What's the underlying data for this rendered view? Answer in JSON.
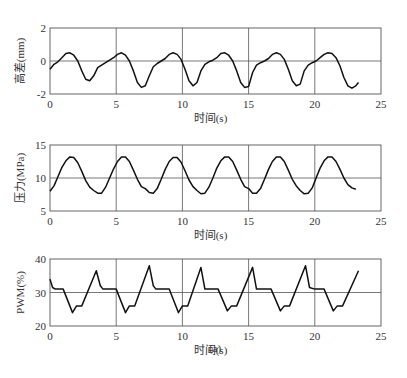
{
  "caption": "(a)",
  "chart_data": [
    {
      "type": "line",
      "title": "",
      "xlabel": "时间(s)",
      "ylabel": "高差(mm)",
      "xlim": [
        0,
        25
      ],
      "ylim": [
        -2,
        2
      ],
      "xticks": [
        0,
        5,
        10,
        15,
        20,
        25
      ],
      "yticks": [
        -2,
        0,
        2
      ],
      "grid": true,
      "frame": {
        "x0": 50,
        "x1": 381,
        "y0": 28,
        "y1": 94
      },
      "series": [
        {
          "name": "高差",
          "x": [
            0,
            0.3,
            0.6,
            0.9,
            1.2,
            1.5,
            1.8,
            2.1,
            2.4,
            2.7,
            3.0,
            3.3,
            3.6,
            3.9,
            4.2,
            4.5,
            4.8,
            5.1,
            5.4,
            5.7,
            6.0,
            6.3,
            6.6,
            6.9,
            7.2,
            7.5,
            7.8,
            8.1,
            8.4,
            8.7,
            9.0,
            9.3,
            9.6,
            9.9,
            10.2,
            10.5,
            10.8,
            11.1,
            11.4,
            11.7,
            12.0,
            12.3,
            12.6,
            12.9,
            13.2,
            13.5,
            13.8,
            14.1,
            14.4,
            14.7,
            15.0,
            15.3,
            15.6,
            15.9,
            16.2,
            16.5,
            16.8,
            17.1,
            17.4,
            17.7,
            18.0,
            18.3,
            18.6,
            18.9,
            19.2,
            19.5,
            19.8,
            20.1,
            20.4,
            20.7,
            21.0,
            21.3,
            21.6,
            21.9,
            22.2,
            22.5,
            22.8,
            23.1,
            23.3
          ],
          "values": [
            -0.5,
            -0.2,
            -0.05,
            0.2,
            0.45,
            0.5,
            0.35,
            0.0,
            -0.6,
            -1.1,
            -1.2,
            -0.9,
            -0.4,
            -0.25,
            -0.1,
            0.05,
            0.2,
            0.4,
            0.5,
            0.35,
            0.0,
            -0.6,
            -1.3,
            -1.6,
            -1.5,
            -0.9,
            -0.35,
            -0.15,
            0.0,
            0.15,
            0.4,
            0.5,
            0.4,
            0.1,
            -0.5,
            -1.2,
            -1.5,
            -1.3,
            -0.6,
            -0.2,
            -0.05,
            0.05,
            0.2,
            0.45,
            0.5,
            0.35,
            0.0,
            -0.6,
            -1.3,
            -1.6,
            -1.55,
            -0.7,
            -0.25,
            -0.1,
            0.0,
            0.15,
            0.4,
            0.5,
            0.4,
            0.1,
            -0.5,
            -1.2,
            -1.5,
            -1.4,
            -0.6,
            -0.25,
            -0.1,
            0.0,
            0.2,
            0.4,
            0.5,
            0.45,
            0.2,
            -0.3,
            -1.0,
            -1.5,
            -1.65,
            -1.5,
            -1.3
          ]
        }
      ]
    },
    {
      "type": "line",
      "title": "",
      "xlabel": "时间(s)",
      "ylabel": "压力(MPa)",
      "xlim": [
        0,
        25
      ],
      "ylim": [
        5,
        15
      ],
      "xticks": [
        0,
        5,
        10,
        15,
        20,
        25
      ],
      "yticks": [
        5,
        10,
        15
      ],
      "grid": true,
      "frame": {
        "x0": 50,
        "x1": 381,
        "y0": 145,
        "y1": 211
      },
      "series": [
        {
          "name": "压力",
          "x": [
            0,
            0.3,
            0.6,
            0.9,
            1.2,
            1.5,
            1.8,
            2.1,
            2.4,
            2.7,
            3.0,
            3.3,
            3.6,
            3.9,
            4.2,
            4.5,
            4.8,
            5.1,
            5.4,
            5.7,
            6.0,
            6.3,
            6.6,
            6.9,
            7.2,
            7.5,
            7.8,
            8.1,
            8.4,
            8.7,
            9.0,
            9.3,
            9.6,
            9.9,
            10.2,
            10.5,
            10.8,
            11.1,
            11.4,
            11.7,
            12.0,
            12.3,
            12.6,
            12.9,
            13.2,
            13.5,
            13.8,
            14.1,
            14.4,
            14.7,
            15.0,
            15.3,
            15.6,
            15.9,
            16.2,
            16.5,
            16.8,
            17.1,
            17.4,
            17.7,
            18.0,
            18.3,
            18.6,
            18.9,
            19.2,
            19.5,
            19.8,
            20.1,
            20.4,
            20.7,
            21.0,
            21.3,
            21.6,
            21.9,
            22.2,
            22.5,
            22.8,
            23.1,
            23.3
          ],
          "values": [
            8.0,
            8.8,
            10.2,
            11.6,
            12.6,
            13.2,
            13.1,
            12.3,
            11.0,
            9.6,
            8.6,
            8.1,
            7.7,
            7.7,
            8.6,
            10.0,
            11.4,
            12.5,
            13.2,
            13.2,
            12.5,
            11.2,
            9.8,
            8.7,
            8.4,
            7.8,
            7.7,
            8.4,
            9.8,
            11.3,
            12.5,
            13.1,
            13.1,
            12.4,
            11.1,
            9.7,
            8.7,
            8.1,
            7.6,
            7.7,
            8.6,
            10.0,
            11.5,
            12.6,
            13.2,
            13.2,
            12.5,
            11.2,
            9.8,
            8.7,
            8.4,
            7.7,
            7.7,
            8.4,
            9.8,
            11.3,
            12.5,
            13.2,
            13.2,
            12.5,
            11.2,
            9.8,
            8.8,
            8.1,
            7.6,
            7.7,
            8.5,
            10.0,
            11.5,
            12.6,
            13.2,
            13.2,
            12.5,
            11.3,
            10.0,
            9.0,
            8.5,
            8.3
          ]
        }
      ]
    },
    {
      "type": "line",
      "title": "",
      "xlabel": "时间(s)",
      "ylabel": "PWM(%)",
      "xlim": [
        0,
        25
      ],
      "ylim": [
        20,
        40
      ],
      "xticks": [
        0,
        5,
        10,
        15,
        20,
        25
      ],
      "yticks": [
        20,
        30,
        40
      ],
      "grid": true,
      "frame": {
        "x0": 50,
        "x1": 381,
        "y0": 259,
        "y1": 326
      },
      "series": [
        {
          "name": "PWM",
          "x": [
            0,
            0.2,
            0.4,
            1.0,
            1.7,
            2.0,
            2.4,
            3.5,
            3.8,
            4.0,
            5.0,
            5.7,
            6.0,
            6.4,
            7.5,
            7.8,
            8.0,
            9.0,
            9.7,
            10.0,
            10.4,
            11.4,
            11.7,
            12.7,
            13.4,
            13.7,
            14.1,
            15.3,
            15.6,
            16.7,
            17.4,
            17.7,
            18.1,
            19.3,
            19.6,
            20.0,
            20.7,
            21.4,
            21.7,
            22.1,
            23.3
          ],
          "values": [
            34,
            31.5,
            31,
            31,
            24,
            26,
            26,
            36.5,
            32,
            31,
            31,
            24,
            26,
            26,
            38,
            32,
            31,
            31,
            24,
            26,
            26,
            37.5,
            31,
            31,
            24.5,
            26,
            26,
            37.5,
            31,
            31,
            24.5,
            26,
            26,
            38,
            31.5,
            31,
            31,
            24.5,
            26,
            26,
            36.5
          ]
        }
      ]
    }
  ]
}
